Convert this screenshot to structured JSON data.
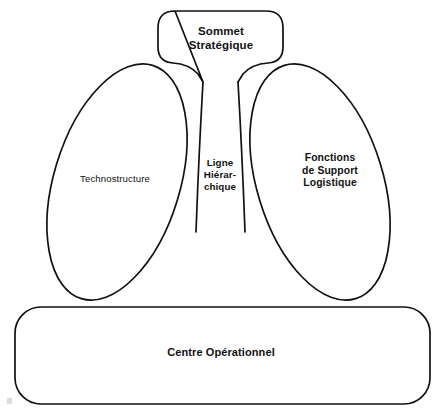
{
  "diagram": {
    "background_color": "#ffffff",
    "line_color": "#111111",
    "text_color": "#121212",
    "shapes": {
      "apex": {
        "name": "rounded-box",
        "label": "Sommet\nStratégique"
      },
      "left_ellipse": {
        "name": "tilted-ellipse",
        "label": "Technostructure"
      },
      "middle_line": {
        "name": "gap-channel",
        "label": "Ligne\nHiérar-\nchique"
      },
      "right_ellipse": {
        "name": "tilted-ellipse",
        "label": "Fonctions\nde Support\nLogistique"
      },
      "base": {
        "name": "rounded-rectangle",
        "label": "Centre  Opérationnel"
      }
    }
  }
}
